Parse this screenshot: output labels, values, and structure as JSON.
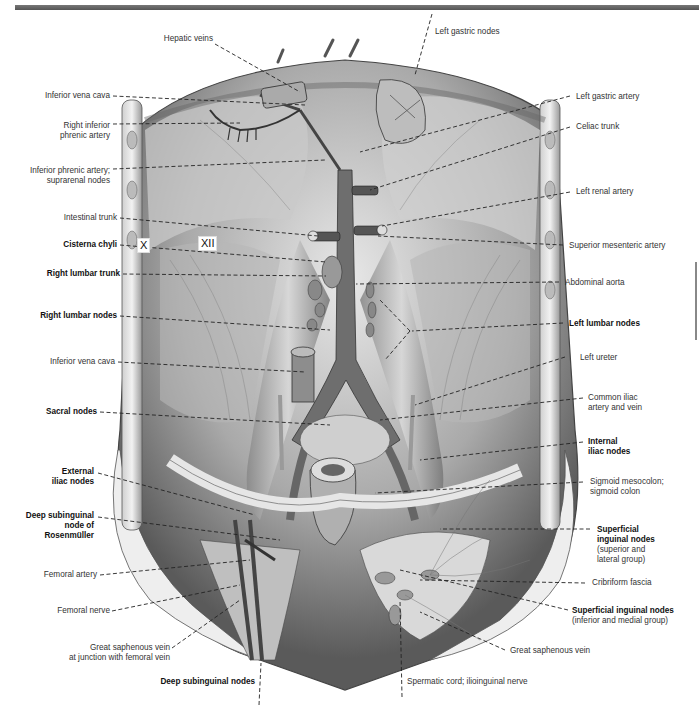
{
  "page": {
    "header_bar_color": "#666666",
    "figure_type": "anatomical illustration"
  },
  "vertebra_markers": {
    "rib_x": "X",
    "rib_xii": "XII"
  },
  "labels_left": [
    {
      "id": "hepatic-veins",
      "lines": [
        "Hepatic veins"
      ],
      "bold": false
    },
    {
      "id": "inferior-vena-cava-upper",
      "lines": [
        "Inferior vena cava"
      ],
      "bold": false
    },
    {
      "id": "right-inferior-phrenic-artery",
      "lines": [
        "Right inferior",
        "phrenic artery"
      ],
      "bold": false
    },
    {
      "id": "inferior-phrenic-artery-suprarenal-nodes",
      "lines": [
        "Inferior phrenic artery;",
        "suprarenal nodes"
      ],
      "bold": false
    },
    {
      "id": "intestinal-trunk",
      "lines": [
        "Intestinal trunk"
      ],
      "bold": false
    },
    {
      "id": "cisterna-chyli",
      "lines": [
        "Cisterna chyli"
      ],
      "bold": true
    },
    {
      "id": "right-lumbar-trunk",
      "lines": [
        "Right lumbar trunk"
      ],
      "bold": true
    },
    {
      "id": "right-lumbar-nodes",
      "lines": [
        "Right lumbar nodes"
      ],
      "bold": true
    },
    {
      "id": "inferior-vena-cava-lower",
      "lines": [
        "Inferior vena cava"
      ],
      "bold": false
    },
    {
      "id": "sacral-nodes",
      "lines": [
        "Sacral nodes"
      ],
      "bold": true
    },
    {
      "id": "external-iliac-nodes",
      "lines": [
        "External",
        "iliac nodes"
      ],
      "bold": true
    },
    {
      "id": "deep-subinguinal-node-rosenmuller",
      "lines": [
        "Deep subinguinal",
        "node of",
        "Rosenmüller"
      ],
      "bold": true
    },
    {
      "id": "femoral-artery",
      "lines": [
        "Femoral artery"
      ],
      "bold": false
    },
    {
      "id": "femoral-nerve",
      "lines": [
        "Femoral nerve"
      ],
      "bold": false
    },
    {
      "id": "great-saphenous-vein-junction",
      "lines": [
        "Great saphenous vein",
        "at junction with femoral vein"
      ],
      "bold": false
    },
    {
      "id": "deep-subinguinal-nodes",
      "lines": [
        "Deep subinguinal nodes"
      ],
      "bold": true
    }
  ],
  "labels_right": [
    {
      "id": "left-gastric-nodes",
      "lines": [
        "Left gastric nodes"
      ],
      "bold": false
    },
    {
      "id": "left-gastric-artery",
      "lines": [
        "Left gastric artery"
      ],
      "bold": false
    },
    {
      "id": "celiac-trunk",
      "lines": [
        "Celiac trunk"
      ],
      "bold": false
    },
    {
      "id": "left-renal-artery",
      "lines": [
        "Left renal artery"
      ],
      "bold": false
    },
    {
      "id": "superior-mesenteric-artery",
      "lines": [
        "Superior mesenteric artery"
      ],
      "bold": false
    },
    {
      "id": "abdominal-aorta",
      "lines": [
        "Abdominal aorta"
      ],
      "bold": false
    },
    {
      "id": "left-lumbar-nodes",
      "lines": [
        "Left lumbar nodes"
      ],
      "bold": true
    },
    {
      "id": "left-ureter",
      "lines": [
        "Left ureter"
      ],
      "bold": false
    },
    {
      "id": "common-iliac-artery-vein",
      "lines": [
        "Common iliac",
        "artery and vein"
      ],
      "bold": false
    },
    {
      "id": "internal-iliac-nodes",
      "lines": [
        "Internal",
        "iliac nodes"
      ],
      "bold": true
    },
    {
      "id": "sigmoid-mesocolon",
      "lines": [
        "Sigmoid mesocolon;",
        "sigmoid colon"
      ],
      "bold": false
    },
    {
      "id": "superficial-inguinal-nodes-superior",
      "lines": [
        "Superficial",
        "inguinal nodes"
      ],
      "sub": [
        "(superior and",
        "lateral group)"
      ],
      "bold": true
    },
    {
      "id": "cribriform-fascia",
      "lines": [
        "Cribriform fascia"
      ],
      "bold": false
    },
    {
      "id": "superficial-inguinal-nodes-inferior",
      "lines": [
        "Superficial inguinal nodes"
      ],
      "sub": [
        "(inferior and medial group)"
      ],
      "bold": true
    },
    {
      "id": "great-saphenous-vein",
      "lines": [
        "Great saphenous vein"
      ],
      "bold": false
    },
    {
      "id": "spermatic-cord-ilioinguinal-nerve",
      "lines": [
        "Spermatic cord; ilioinguinal nerve"
      ],
      "bold": false
    }
  ]
}
